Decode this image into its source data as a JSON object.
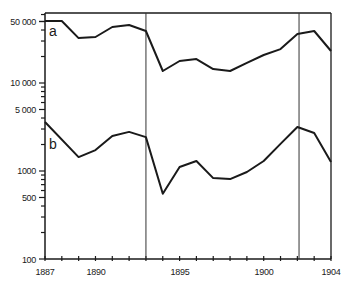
{
  "chart_data": {
    "type": "line",
    "title": "",
    "xlabel": "",
    "ylabel": "",
    "y_scale": "log",
    "ylim": [
      100,
      70000
    ],
    "xlim": [
      1887,
      1904
    ],
    "grid": false,
    "legend_position": "inline labels at left",
    "x": [
      1887,
      1888,
      1889,
      1890,
      1891,
      1892,
      1893,
      1894,
      1895,
      1896,
      1897,
      1898,
      1899,
      1900,
      1901,
      1902,
      1903,
      1904
    ],
    "series": [
      {
        "name": "a",
        "values": [
          50700,
          50700,
          32400,
          33300,
          43300,
          45600,
          39000,
          13700,
          17800,
          18700,
          14400,
          13700,
          16900,
          20800,
          24300,
          36100,
          39000,
          23100
        ]
      },
      {
        "name": "b",
        "values": [
          3600,
          null,
          1440,
          1730,
          2500,
          2780,
          2430,
          550,
          1110,
          1300,
          830,
          810,
          975,
          1300,
          2030,
          3160,
          2700,
          1265
        ]
      }
    ],
    "y_tick_labels": [
      "50 000",
      "10 000",
      "5 000",
      "1000",
      "500",
      "100"
    ],
    "y_tick_values": [
      50000,
      10000,
      5000,
      1000,
      500,
      100
    ],
    "x_tick_labels": [
      "1887",
      "1890",
      "1895",
      "1900",
      "1904"
    ],
    "x_tick_values": [
      1887,
      1890,
      1895,
      1900,
      1904
    ],
    "vertical_markers": [
      1893,
      1902.1
    ],
    "annotations": [
      "a",
      "b"
    ]
  },
  "labels": {
    "series_a": "a",
    "series_b": "b",
    "y_ticks": [
      "50 000",
      "10 000",
      "5 000",
      "1000",
      "500",
      "100"
    ],
    "x_ticks": [
      "1887",
      "1890",
      "1895",
      "1900",
      "1904"
    ]
  }
}
